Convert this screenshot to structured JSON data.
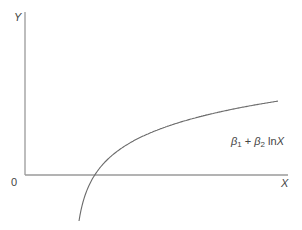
{
  "chart_data": {
    "type": "line",
    "title": "",
    "xlabel": "X",
    "ylabel": "Y",
    "origin_label": "0",
    "grid": false,
    "legend": null,
    "series": [
      {
        "name": "β1 + β2 lnX",
        "function": "Y = β1 + β2 ln X",
        "description": "Concave logarithmic curve rising from below the X axis, crossing it, then flattening",
        "annotation": {
          "text_parts": [
            "β",
            "1",
            " + β",
            "2",
            " ln",
            "X"
          ]
        }
      }
    ],
    "axes": {
      "x": {
        "label": "X",
        "ticks": []
      },
      "y": {
        "label": "Y",
        "ticks": []
      }
    }
  },
  "labels": {
    "y_axis": "Y",
    "x_axis": "X",
    "origin": "0",
    "beta": "β",
    "sub1": "1",
    "plus": " + ",
    "sub2": "2",
    "ln": " ln",
    "x_var": "X"
  },
  "render": {
    "axis_color": "#9a9a9a",
    "curve_color": "#6b6b6b",
    "axis_origin_px": [
      25,
      175
    ],
    "x_axis_end_px": 288,
    "y_axis_top_px": 12,
    "curve_x_shift": 74,
    "curve_intercept": 273.1,
    "curve_slope": -32.35,
    "curve_x_start_px": 79,
    "curve_x_end_px": 278
  }
}
